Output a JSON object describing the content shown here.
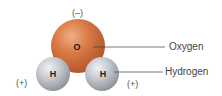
{
  "diagram": {
    "molecule": "water",
    "atoms": {
      "oxygen": {
        "symbol": "O",
        "charge": "(–)",
        "color": "#d2733f",
        "highlight": "#eda27a",
        "shadow": "#a94f22"
      },
      "hydrogen_left": {
        "symbol": "H",
        "charge": "(+)",
        "color": "#b8bcc4",
        "highlight": "#eef0f3",
        "shadow": "#8a8f98"
      },
      "hydrogen_right": {
        "symbol": "H",
        "charge": "(+)",
        "color": "#b8bcc4",
        "highlight": "#eef0f3",
        "shadow": "#8a8f98"
      }
    },
    "callouts": {
      "oxygen_label": "Oxygen",
      "hydrogen_label": "Hydrogen"
    },
    "leader_line_color": "#555555"
  }
}
